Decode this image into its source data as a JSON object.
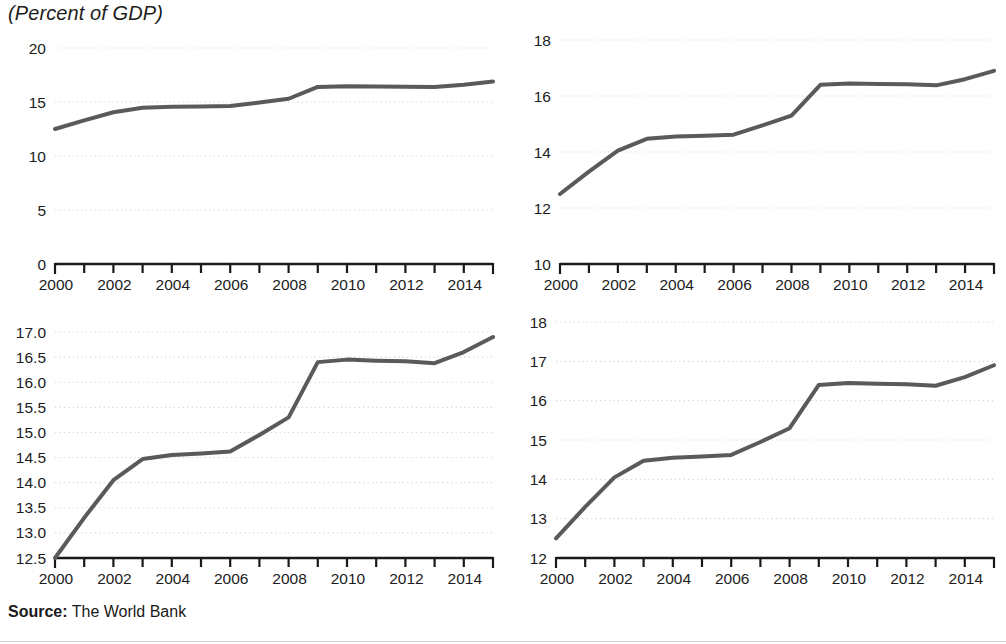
{
  "title": "(Percent of GDP)",
  "source": {
    "label": "Source:",
    "value": " The World Bank"
  },
  "style": {
    "line_color": "#5a5a5a",
    "axis_color": "#1a1a1a",
    "grid_color": "#d9d9d9",
    "text_color": "#1c1c1c",
    "background": "#ffffff"
  },
  "chart_data": [
    {
      "id": "top-left",
      "type": "line",
      "title": "(Percent of GDP)",
      "xlabel": "",
      "ylabel": "",
      "grid": true,
      "legend": "none",
      "xlim": [
        2000,
        2015
      ],
      "ylim": [
        0,
        20
      ],
      "yticks": [
        0,
        5,
        10,
        15,
        20
      ],
      "ytick_labels": [
        "0",
        "5",
        "10",
        "15",
        "20"
      ],
      "xticks": [
        2000,
        2001,
        2002,
        2003,
        2004,
        2005,
        2006,
        2007,
        2008,
        2009,
        2010,
        2011,
        2012,
        2013,
        2014,
        2015
      ],
      "xtick_labels": [
        "2000",
        "",
        "2002",
        "",
        "2004",
        "",
        "2006",
        "",
        "2008",
        "",
        "2010",
        "",
        "2012",
        "",
        "2014",
        ""
      ],
      "x": [
        2000,
        2001,
        2002,
        2003,
        2004,
        2005,
        2006,
        2007,
        2008,
        2009,
        2010,
        2011,
        2012,
        2013,
        2014,
        2015
      ],
      "values": [
        12.5,
        13.3,
        14.05,
        14.47,
        14.55,
        14.58,
        14.62,
        14.95,
        15.3,
        16.4,
        16.45,
        16.43,
        16.42,
        16.38,
        16.6,
        16.9
      ]
    },
    {
      "id": "top-right",
      "type": "line",
      "title": "",
      "xlabel": "",
      "ylabel": "",
      "grid": true,
      "legend": "none",
      "xlim": [
        2000,
        2015
      ],
      "ylim": [
        10,
        18
      ],
      "yticks": [
        10,
        12,
        14,
        16,
        18
      ],
      "ytick_labels": [
        "10",
        "12",
        "14",
        "16",
        "18"
      ],
      "xticks": [
        2000,
        2001,
        2002,
        2003,
        2004,
        2005,
        2006,
        2007,
        2008,
        2009,
        2010,
        2011,
        2012,
        2013,
        2014,
        2015
      ],
      "xtick_labels": [
        "2000",
        "",
        "2002",
        "",
        "2004",
        "",
        "2006",
        "",
        "2008",
        "",
        "2010",
        "",
        "2012",
        "",
        "2014",
        ""
      ],
      "x": [
        2000,
        2001,
        2002,
        2003,
        2004,
        2005,
        2006,
        2007,
        2008,
        2009,
        2010,
        2011,
        2012,
        2013,
        2014,
        2015
      ],
      "values": [
        12.5,
        13.3,
        14.05,
        14.47,
        14.55,
        14.58,
        14.62,
        14.95,
        15.3,
        16.4,
        16.45,
        16.43,
        16.42,
        16.38,
        16.6,
        16.9
      ]
    },
    {
      "id": "bottom-left",
      "type": "line",
      "title": "",
      "xlabel": "",
      "ylabel": "",
      "grid": true,
      "legend": "none",
      "xlim": [
        2000,
        2015
      ],
      "ylim": [
        12.5,
        17.0
      ],
      "yticks": [
        12.5,
        13.0,
        13.5,
        14.0,
        14.5,
        15.0,
        15.5,
        16.0,
        16.5,
        17.0
      ],
      "ytick_labels": [
        "12.5",
        "13.0",
        "13.5",
        "14.0",
        "14.5",
        "15.0",
        "15.5",
        "16.0",
        "16.5",
        "17.0"
      ],
      "xticks": [
        2000,
        2001,
        2002,
        2003,
        2004,
        2005,
        2006,
        2007,
        2008,
        2009,
        2010,
        2011,
        2012,
        2013,
        2014,
        2015
      ],
      "xtick_labels": [
        "2000",
        "",
        "2002",
        "",
        "2004",
        "",
        "2006",
        "",
        "2008",
        "",
        "2010",
        "",
        "2012",
        "",
        "2014",
        ""
      ],
      "x": [
        2000,
        2001,
        2002,
        2003,
        2004,
        2005,
        2006,
        2007,
        2008,
        2009,
        2010,
        2011,
        2012,
        2013,
        2014,
        2015
      ],
      "values": [
        12.5,
        13.3,
        14.05,
        14.47,
        14.55,
        14.58,
        14.62,
        14.95,
        15.3,
        16.4,
        16.45,
        16.43,
        16.42,
        16.38,
        16.6,
        16.9
      ]
    },
    {
      "id": "bottom-right",
      "type": "line",
      "title": "",
      "xlabel": "",
      "ylabel": "",
      "grid": true,
      "legend": "none",
      "xlim": [
        2000,
        2015
      ],
      "ylim": [
        12,
        18
      ],
      "yticks": [
        12,
        13,
        14,
        15,
        16,
        17,
        18
      ],
      "ytick_labels": [
        "12",
        "13",
        "14",
        "15",
        "16",
        "17",
        "18"
      ],
      "xticks": [
        2000,
        2001,
        2002,
        2003,
        2004,
        2005,
        2006,
        2007,
        2008,
        2009,
        2010,
        2011,
        2012,
        2013,
        2014,
        2015
      ],
      "xtick_labels": [
        "2000",
        "",
        "2002",
        "",
        "2004",
        "",
        "2006",
        "",
        "2008",
        "",
        "2010",
        "",
        "2012",
        "",
        "2014",
        ""
      ],
      "x": [
        2000,
        2001,
        2002,
        2003,
        2004,
        2005,
        2006,
        2007,
        2008,
        2009,
        2010,
        2011,
        2012,
        2013,
        2014,
        2015
      ],
      "values": [
        12.5,
        13.3,
        14.05,
        14.47,
        14.55,
        14.58,
        14.62,
        14.95,
        15.3,
        16.4,
        16.45,
        16.43,
        16.42,
        16.38,
        16.6,
        16.9
      ]
    }
  ]
}
